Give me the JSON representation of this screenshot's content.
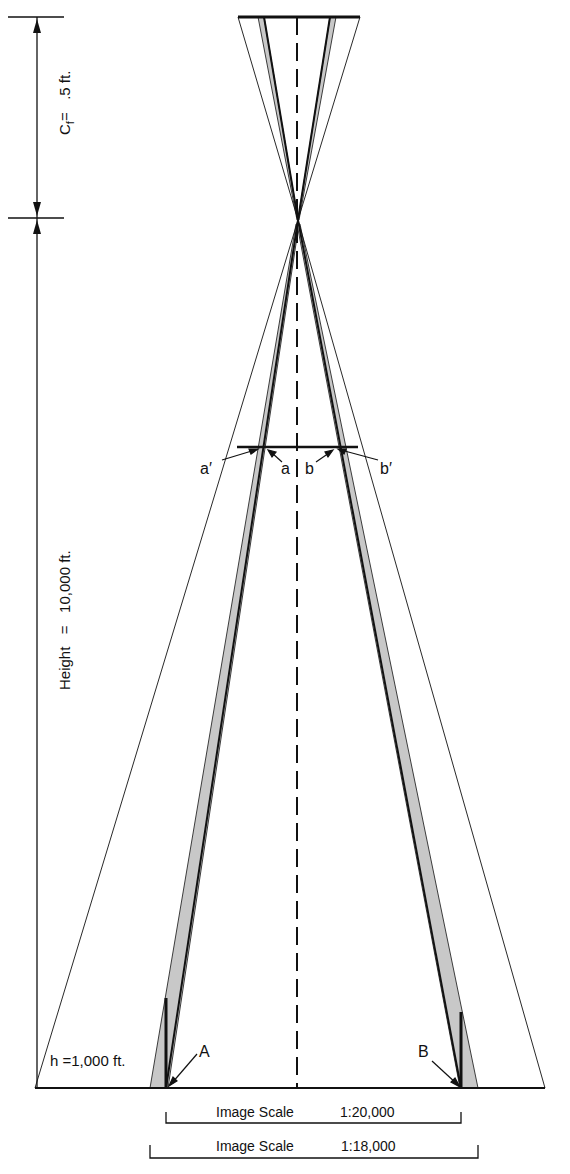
{
  "figure": {
    "focal_length_label": "C",
    "focal_length_subscript": "f",
    "focal_length_value": "=   .5 ft.",
    "height_label": "Height   =   10,000 ft.",
    "object_height_label": "h =1,000 ft.",
    "point_labels": {
      "a_prime": "a′",
      "a": "a",
      "b": "b",
      "b_prime": "b′",
      "A": "A",
      "B": "B"
    },
    "scale_bars": [
      {
        "label": "Image Scale",
        "value": "1:20,000"
      },
      {
        "label": "Image Scale",
        "value": "1:18,000"
      }
    ],
    "colors": {
      "line": "#111111",
      "shade": "#c8c8c8",
      "background": "#ffffff"
    }
  }
}
